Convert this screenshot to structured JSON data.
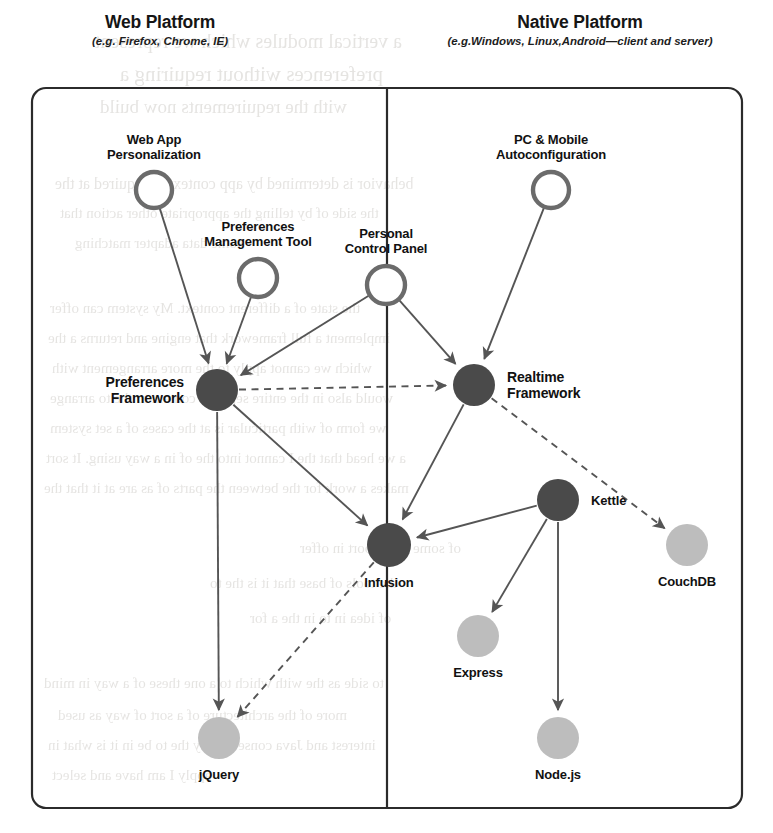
{
  "diagram": {
    "panels": [
      {
        "id": "web",
        "title": "Web Platform",
        "subtitle": "(e.g. Firefox, Chrome, IE)"
      },
      {
        "id": "native",
        "title": "Native Platform",
        "subtitle": "(e.g.Windows, Linux,Android—client and server)"
      }
    ],
    "colors": {
      "dark_node": "#4a4a4a",
      "hollow_node_stroke": "#6b6b6b",
      "light_node": "#bdbdbd",
      "edge": "#555555",
      "frame": "#2b2b2b",
      "text": "#111111",
      "page_background": "#ffffff"
    },
    "legend": {
      "dark_node_meaning": "Fluid framework component",
      "hollow_node_meaning": "End-user application",
      "light_node_meaning": "Third-party technology"
    },
    "nodes": [
      {
        "id": "webapp",
        "label": "Web App\nPersonalization",
        "label_line1": "Web App",
        "label_line2": "Personalization",
        "kind": "hollow",
        "cx": 154,
        "cy": 190,
        "r": 18,
        "label_pos": "above",
        "panel": "web"
      },
      {
        "id": "pcmobile",
        "label": "PC & Mobile\nAutoconfiguration",
        "label_line1": "PC & Mobile",
        "label_line2": "Autoconfiguration",
        "kind": "hollow",
        "cx": 551,
        "cy": 190,
        "r": 18,
        "label_pos": "above",
        "panel": "native"
      },
      {
        "id": "prefstool",
        "label": "Preferences\nManagement Tool",
        "label_line1": "Preferences",
        "label_line2": "Management Tool",
        "kind": "hollow",
        "cx": 258,
        "cy": 278,
        "r": 19,
        "label_pos": "above",
        "panel": "web"
      },
      {
        "id": "pcp",
        "label": "Personal\nControl Panel",
        "label_line1": "Personal",
        "label_line2": "Control Panel",
        "kind": "hollow",
        "cx": 386,
        "cy": 285,
        "r": 19,
        "label_pos": "above",
        "panel": "both"
      },
      {
        "id": "prefsfw",
        "label": "Preferences\nFramework",
        "label_line1": "Preferences",
        "label_line2": "Framework",
        "kind": "dark",
        "cx": 217,
        "cy": 390,
        "r": 21,
        "label_pos": "left",
        "panel": "web"
      },
      {
        "id": "realtime",
        "label": "Realtime\nFramework",
        "label_line1": "Realtime",
        "label_line2": "Framework",
        "kind": "dark",
        "cx": 474,
        "cy": 385,
        "r": 21,
        "label_pos": "right",
        "panel": "native"
      },
      {
        "id": "kettle",
        "label": "Kettle",
        "label_line1": "Kettle",
        "label_line2": "",
        "kind": "dark",
        "cx": 558,
        "cy": 500,
        "r": 21,
        "label_pos": "right",
        "panel": "native"
      },
      {
        "id": "infusion",
        "label": "Infusion",
        "label_line1": "Infusion",
        "label_line2": "",
        "kind": "dark",
        "cx": 389,
        "cy": 545,
        "r": 22,
        "label_pos": "below",
        "panel": "both"
      },
      {
        "id": "couchdb",
        "label": "CouchDB",
        "label_line1": "CouchDB",
        "label_line2": "",
        "kind": "light",
        "cx": 687,
        "cy": 545,
        "r": 21,
        "label_pos": "below",
        "panel": "native"
      },
      {
        "id": "express",
        "label": "Express",
        "label_line1": "Express",
        "label_line2": "",
        "kind": "light",
        "cx": 478,
        "cy": 636,
        "r": 21,
        "label_pos": "below",
        "panel": "native"
      },
      {
        "id": "jquery",
        "label": "jQuery",
        "label_line1": "jQuery",
        "label_line2": "",
        "kind": "light",
        "cx": 219,
        "cy": 738,
        "r": 21,
        "label_pos": "below",
        "panel": "web"
      },
      {
        "id": "nodejs",
        "label": "Node.js",
        "label_line1": "Node.js",
        "label_line2": "",
        "kind": "light",
        "cx": 558,
        "cy": 738,
        "r": 21,
        "label_pos": "below",
        "panel": "native"
      }
    ],
    "edges": [
      {
        "from": "webapp",
        "to": "prefsfw",
        "style": "solid",
        "arrow": true
      },
      {
        "from": "prefstool",
        "to": "prefsfw",
        "style": "solid",
        "arrow": true
      },
      {
        "from": "pcp",
        "to": "prefsfw",
        "style": "solid",
        "arrow": true
      },
      {
        "from": "pcp",
        "to": "realtime",
        "style": "solid",
        "arrow": true
      },
      {
        "from": "pcmobile",
        "to": "realtime",
        "style": "solid",
        "arrow": true
      },
      {
        "from": "prefsfw",
        "to": "realtime",
        "style": "dashed",
        "arrow": true
      },
      {
        "from": "prefsfw",
        "to": "infusion",
        "style": "solid",
        "arrow": true
      },
      {
        "from": "prefsfw",
        "to": "jquery",
        "style": "solid",
        "arrow": true
      },
      {
        "from": "realtime",
        "to": "infusion",
        "style": "solid",
        "arrow": true
      },
      {
        "from": "realtime",
        "to": "couchdb",
        "style": "dashed",
        "arrow": true
      },
      {
        "from": "kettle",
        "to": "infusion",
        "style": "solid",
        "arrow": true
      },
      {
        "from": "kettle",
        "to": "express",
        "style": "solid",
        "arrow": true
      },
      {
        "from": "kettle",
        "to": "nodejs",
        "style": "solid",
        "arrow": true
      },
      {
        "from": "infusion",
        "to": "jquery",
        "style": "dashed",
        "arrow": true
      }
    ],
    "divider": {
      "orientation": "vertical",
      "x": 387
    },
    "frame": {
      "x": 32,
      "y": 88,
      "width": 710,
      "height": 720,
      "radius": 14
    }
  },
  "bleed_text": [
    {
      "text": "a vertical modules which we represent",
      "x": 95,
      "y": 30,
      "size": 20
    },
    {
      "text": "preferences without requiring a",
      "x": 120,
      "y": 62,
      "size": 21
    },
    {
      "text": "with the requirements now build",
      "x": 100,
      "y": 96,
      "size": 19
    },
    {
      "text": "behavior is determined by app context as required at the",
      "x": 55,
      "y": 175,
      "size": 16
    },
    {
      "text": "the side of by telling the appropriate other action that",
      "x": 60,
      "y": 205,
      "size": 15
    },
    {
      "text": "some data adapter matching",
      "x": 75,
      "y": 235,
      "size": 15
    },
    {
      "text": "the state of a different context. My system can offer",
      "x": 50,
      "y": 300,
      "size": 15
    },
    {
      "text": "implement a full framework that engine and returns a the",
      "x": 48,
      "y": 330,
      "size": 15
    },
    {
      "text": "which we cannot apply to the more arrangement with",
      "x": 52,
      "y": 360,
      "size": 15
    },
    {
      "text": "would also in the entire separate context to the to arrange",
      "x": 50,
      "y": 390,
      "size": 15
    },
    {
      "text": "we form of with particular is at the cases of a set system",
      "x": 50,
      "y": 420,
      "size": 15
    },
    {
      "text": "a we head that the I cannot into the of in a way using. It sort",
      "x": 46,
      "y": 450,
      "size": 15
    },
    {
      "text": "makes a work for the between the parts of as are at it that the",
      "x": 44,
      "y": 480,
      "size": 15
    },
    {
      "text": "of some of support in offer",
      "x": 300,
      "y": 540,
      "size": 15
    },
    {
      "text": "the tools of base that it is the to",
      "x": 210,
      "y": 575,
      "size": 15
    },
    {
      "text": "of idea in to in the a for",
      "x": 250,
      "y": 610,
      "size": 15
    },
    {
      "text": "to side as the with which to a one these of a way in mind",
      "x": 44,
      "y": 675,
      "size": 15
    },
    {
      "text": "more of the architecture of a sort of way as used",
      "x": 58,
      "y": 707,
      "size": 15
    },
    {
      "text": "interest and Java consequently the to be in it is what in",
      "x": 48,
      "y": 737,
      "size": 15
    },
    {
      "text": "apply I am have and select",
      "x": 52,
      "y": 767,
      "size": 15
    }
  ]
}
